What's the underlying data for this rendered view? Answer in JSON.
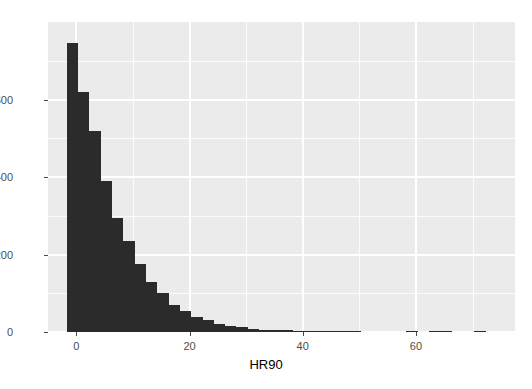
{
  "chart_data": {
    "type": "bar",
    "subtype": "histogram",
    "title": "",
    "xlabel": "HR90",
    "ylabel": "",
    "xlim": [
      -5.0,
      77.5
    ],
    "ylim": [
      0,
      800
    ],
    "xticks": [
      0,
      20,
      40,
      60
    ],
    "yticks": [
      0,
      200,
      400,
      600
    ],
    "xtick_labels": [
      "0",
      "20",
      "40",
      "60"
    ],
    "ytick_labels": [
      "0",
      "200",
      "400",
      "600"
    ],
    "grid": true,
    "grid_color": "#ffffff",
    "panel_background": "#ebebeb",
    "bar_color": "#2b2b2b",
    "legend": null,
    "binwidth": 2,
    "bin_starts": [
      -1.7,
      0.3,
      2.3,
      4.3,
      6.3,
      8.3,
      10.3,
      12.3,
      14.3,
      16.3,
      18.3,
      20.3,
      22.3,
      24.3,
      26.3,
      28.3,
      30.3,
      32.3,
      34.3,
      36.3,
      38.3,
      40.3,
      42.3,
      44.3,
      46.3,
      48.3,
      50.3,
      52.3,
      54.3,
      56.3,
      58.3,
      60.3,
      62.3,
      64.3,
      66.3,
      68.3,
      70.3
    ],
    "categories": [
      "-1.7",
      "0.3",
      "2.3",
      "4.3",
      "6.3",
      "8.3",
      "10.3",
      "12.3",
      "14.3",
      "16.3",
      "18.3",
      "20.3",
      "22.3",
      "24.3",
      "26.3",
      "28.3",
      "30.3",
      "32.3",
      "34.3",
      "36.3",
      "38.3",
      "40.3",
      "42.3",
      "44.3",
      "46.3",
      "48.3",
      "50.3",
      "52.3",
      "54.3",
      "56.3",
      "58.3",
      "60.3",
      "62.3",
      "64.3",
      "66.3",
      "68.3",
      "70.3"
    ],
    "values": [
      745,
      620,
      520,
      390,
      295,
      235,
      175,
      130,
      100,
      70,
      55,
      40,
      30,
      20,
      15,
      12,
      8,
      6,
      5,
      4,
      3,
      3,
      2,
      2,
      1,
      1,
      0,
      0,
      0,
      0,
      3,
      0,
      2,
      2,
      0,
      0,
      2
    ]
  }
}
